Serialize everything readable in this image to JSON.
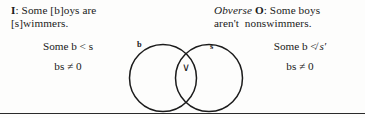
{
  "propositions": {
    "left": {
      "form_label": "I",
      "separator": ": ",
      "line1": "Some [b]oys are",
      "line2": "[s]wimmers.",
      "full_text": "I: Some [b]oys are [s]wimmers."
    },
    "right": {
      "prefix_italic": "Obverse",
      "form_label": "O",
      "separator": ": ",
      "line1": "Some boys",
      "line2": "aren't  nonswimmers.",
      "full_text": "Obverse O: Some boys aren't nonswimmers."
    }
  },
  "formulas": {
    "left_relation": "Some b < s",
    "left_equation": "bs ≠ 0",
    "right_relation_prefix": "Some b ≮ ",
    "right_relation_term": "s′",
    "right_relation_full": "Some b ≮ s′",
    "right_equation": "bs ≠ 0"
  },
  "venn": {
    "left_circle_label": "b",
    "right_circle_label": "s",
    "intersection_mark": "∨",
    "intersection_meaning": "existential-v",
    "stroke_color": "#1b1b1b"
  },
  "colors": {
    "ink": "#1a1a1a",
    "rule": "#2b2b2b",
    "background": "#fdfdfc"
  }
}
